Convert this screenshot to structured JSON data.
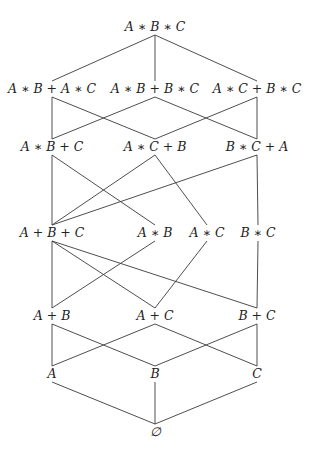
{
  "diagram": {
    "type": "hasse-lattice",
    "nodes": [
      {
        "id": "abc",
        "label": "A ∗ B ∗ C",
        "x": 155,
        "y": 27
      },
      {
        "id": "ab_ac",
        "label": "A ∗ B + A ∗ C",
        "x": 52,
        "y": 89
      },
      {
        "id": "ab_bc",
        "label": "A ∗ B + B ∗ C",
        "x": 155,
        "y": 89
      },
      {
        "id": "ac_bc",
        "label": "A ∗ C + B ∗ C",
        "x": 257,
        "y": 89
      },
      {
        "id": "ab_c",
        "label": "A ∗ B + C",
        "x": 52,
        "y": 147
      },
      {
        "id": "ac_b",
        "label": "A ∗ C + B",
        "x": 155,
        "y": 147
      },
      {
        "id": "bc_a",
        "label": "B ∗ C + A",
        "x": 257,
        "y": 147
      },
      {
        "id": "a_b_c",
        "label": "A + B + C",
        "x": 52,
        "y": 233
      },
      {
        "id": "ab",
        "label": "A ∗ B",
        "x": 155,
        "y": 233
      },
      {
        "id": "ac",
        "label": "A ∗ C",
        "x": 207,
        "y": 233
      },
      {
        "id": "bc",
        "label": "B ∗ C",
        "x": 258,
        "y": 233
      },
      {
        "id": "a_b",
        "label": "A + B",
        "x": 52,
        "y": 316
      },
      {
        "id": "a_c",
        "label": "A + C",
        "x": 155,
        "y": 316
      },
      {
        "id": "b_c",
        "label": "B + C",
        "x": 257,
        "y": 316
      },
      {
        "id": "a",
        "label": "A",
        "x": 52,
        "y": 374
      },
      {
        "id": "b",
        "label": "B",
        "x": 155,
        "y": 374
      },
      {
        "id": "c",
        "label": "C",
        "x": 257,
        "y": 374
      },
      {
        "id": "empty",
        "label": "∅",
        "x": 155,
        "y": 432
      }
    ],
    "edges": [
      [
        "abc",
        "ab_ac"
      ],
      [
        "abc",
        "ab_bc"
      ],
      [
        "abc",
        "ac_bc"
      ],
      [
        "ab_ac",
        "ab_c"
      ],
      [
        "ab_ac",
        "ac_b"
      ],
      [
        "ab_bc",
        "ab_c"
      ],
      [
        "ab_bc",
        "bc_a"
      ],
      [
        "ac_bc",
        "ac_b"
      ],
      [
        "ac_bc",
        "bc_a"
      ],
      [
        "ab_c",
        "a_b_c"
      ],
      [
        "ab_c",
        "ab"
      ],
      [
        "ac_b",
        "a_b_c"
      ],
      [
        "ac_b",
        "ac"
      ],
      [
        "bc_a",
        "a_b_c"
      ],
      [
        "bc_a",
        "bc"
      ],
      [
        "a_b_c",
        "a_b"
      ],
      [
        "a_b_c",
        "a_c"
      ],
      [
        "a_b_c",
        "b_c"
      ],
      [
        "ab",
        "a_b"
      ],
      [
        "ac",
        "a_c"
      ],
      [
        "bc",
        "b_c"
      ],
      [
        "a_b",
        "a"
      ],
      [
        "a_b",
        "b"
      ],
      [
        "a_c",
        "a"
      ],
      [
        "a_c",
        "c"
      ],
      [
        "b_c",
        "b"
      ],
      [
        "b_c",
        "c"
      ],
      [
        "a",
        "empty"
      ],
      [
        "b",
        "empty"
      ],
      [
        "c",
        "empty"
      ]
    ],
    "colors": {
      "line": "#3a3a3a",
      "text": "#222222",
      "background": "#ffffff"
    }
  }
}
